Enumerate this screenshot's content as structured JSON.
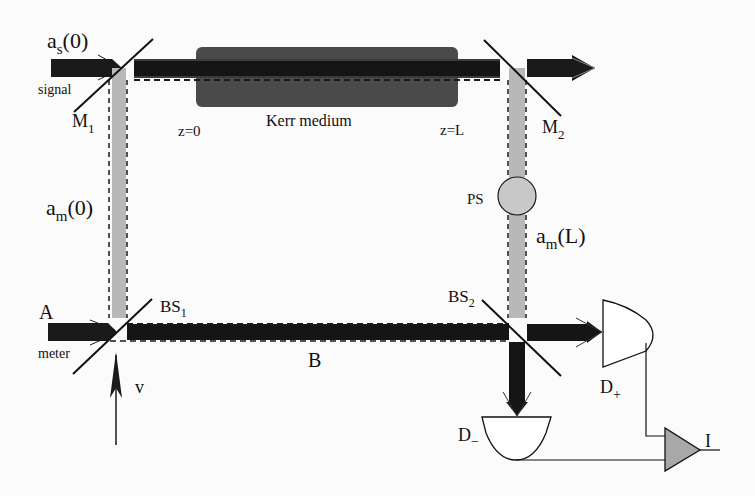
{
  "diagram": {
    "labels": {
      "signal_input": "a",
      "signal_input_sub": "s",
      "signal_input_arg": "(0)",
      "signal": "signal",
      "mirror1": "M",
      "mirror1_sub": "1",
      "z0": "z=0",
      "kerr": "Kerr  medium",
      "zL": "z=L",
      "mirror2": "M",
      "mirror2_sub": "2",
      "meter_mode_start": "a",
      "meter_mode_start_sub": "m",
      "meter_mode_start_arg": "(0)",
      "phase_shifter": "PS",
      "meter_mode_end": "a",
      "meter_mode_end_sub": "m",
      "meter_mode_end_arg": "(L)",
      "bs1": "BS",
      "bs1_sub": "1",
      "bs2": "BS",
      "bs2_sub": "2",
      "port_a": "A",
      "meter": "meter",
      "port_b": "B",
      "vacuum": "v",
      "detector_plus": "D",
      "detector_plus_sub": "+",
      "detector_minus": "D",
      "detector_minus_sub": "−",
      "current": "I"
    },
    "colors": {
      "signal_beam": "#1a1a1a",
      "kerr_medium": "#4a4a4a",
      "meter_beam": "#b8b8b8",
      "phase_shifter": "#c8c8c8",
      "amplifier": "#a8a8a8",
      "line": "#111111"
    }
  }
}
